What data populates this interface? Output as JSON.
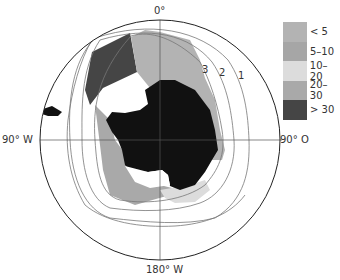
{
  "map": {
    "projection": "south-polar stereographic",
    "axis_labels": {
      "top": "0°",
      "left": "90° W",
      "right": "90° O",
      "bottom": "180° W"
    },
    "contour_labels": [
      "3",
      "2",
      "1"
    ],
    "colors": {
      "land": "#111111",
      "ice_shelf": "#ffffff",
      "circle": "#222222",
      "gridline": "#555555",
      "contour": "#777777"
    }
  },
  "legend": {
    "items": [
      {
        "label": "< 5",
        "color": "#b3b3b3"
      },
      {
        "label": "5–10",
        "color": "#a6a6a6"
      },
      {
        "label": "10–20",
        "color": "#dcdcdc"
      },
      {
        "label": "20–30",
        "color": "#a9a9a9"
      },
      {
        "label": "> 30",
        "color": "#454545"
      }
    ]
  }
}
